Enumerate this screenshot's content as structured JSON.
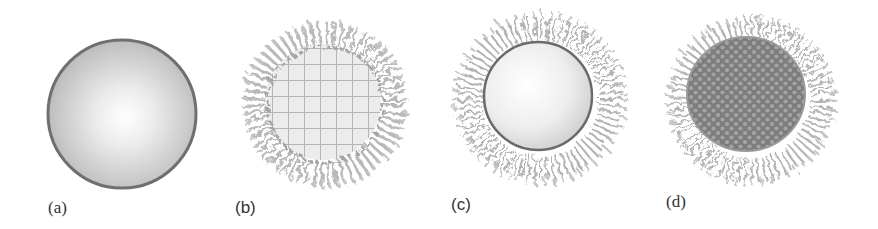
{
  "figure": {
    "panels": [
      {
        "id": "a",
        "label": "(a)",
        "description": "bare nanoparticle, smooth shaded sphere"
      },
      {
        "id": "b",
        "label": "(b)",
        "description": "grid-textured core with polymer brush corona"
      },
      {
        "id": "c",
        "label": "(c)",
        "description": "smooth sphere core with polymer brush corona"
      },
      {
        "id": "d",
        "label": "(d)",
        "description": "dark close-packed textured core with polymer brush corona"
      }
    ]
  },
  "colors": {
    "background": "#ffffff",
    "sphere_edge": "#6f6f6f",
    "sphere_light": "#ffffff",
    "sphere_mid": "#c8c8c8",
    "grid_line": "#b4b4b4",
    "corona": "#a8a8a8",
    "dark_core": "#7c7c7c",
    "dark_core_dot": "#a6a6a6",
    "label_text": "#333333"
  }
}
